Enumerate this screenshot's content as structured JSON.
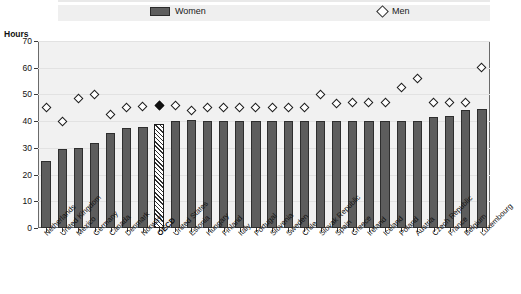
{
  "legend": {
    "women_label": "Women",
    "men_label": "Men",
    "women_swatch_icon": "filled-rect-icon",
    "men_swatch_icon": "open-diamond-icon"
  },
  "axis": {
    "y_unit": "Hours",
    "y_ticks": [
      "0",
      "10",
      "20",
      "30",
      "40",
      "50",
      "60",
      "70"
    ]
  },
  "colors": {
    "women_bar": "#5d5d5d",
    "oecd_bar": "#2e2e2e",
    "men_marker": "#ffffff",
    "oecd_marker": "#111111",
    "plot_background": "#f1f1f1"
  },
  "chart_data": {
    "type": "bar",
    "title": "",
    "xlabel": "",
    "ylabel": "Hours",
    "ylim": [
      0,
      70
    ],
    "grid": true,
    "legend_position": "top",
    "categories": [
      "Netherlands",
      "United Kingdom",
      "Mexico",
      "Germany",
      "Canada",
      "Denmark",
      "Norway",
      "OECD",
      "United States",
      "Estonia",
      "Hungary",
      "Finland",
      "Italy",
      "Portugal",
      "Slovenia",
      "Sweden",
      "Chile",
      "Slovak Republic",
      "Spain",
      "Greece",
      "Ireland",
      "Iceland",
      "Poland",
      "Austria",
      "Czech Republic",
      "France",
      "Belgium",
      "Luxembourg"
    ],
    "highlight_category": "OECD",
    "series": [
      {
        "name": "Women",
        "type": "bar",
        "values": [
          25,
          29.5,
          30,
          32,
          35.5,
          37.5,
          38,
          39,
          40,
          40.5,
          40,
          40,
          40,
          40,
          40,
          40,
          40,
          40,
          40,
          40,
          40,
          40,
          40,
          40,
          41.5,
          42,
          44,
          44.5
        ]
      },
      {
        "name": "Men",
        "type": "scatter",
        "values": [
          45,
          40,
          48.5,
          50,
          42.5,
          45,
          45.5,
          46,
          46,
          44,
          45,
          45,
          45,
          45,
          45,
          45,
          45,
          50,
          46.5,
          47,
          47,
          47,
          52.5,
          56,
          47,
          47,
          47,
          60
        ]
      }
    ]
  }
}
